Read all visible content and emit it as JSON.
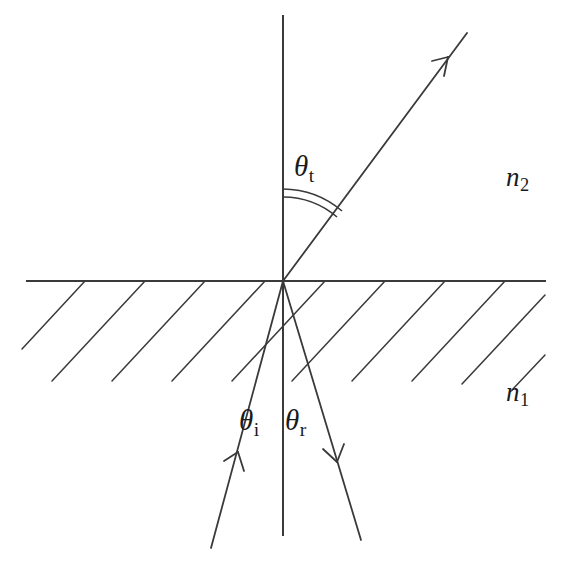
{
  "figure": {
    "type": "optics-refraction-reflection-diagram",
    "background_color": "#ffffff",
    "line_color": "#3a3a3a",
    "width": 566,
    "height": 564
  },
  "labels": {
    "theta_t": {
      "symbol": "θ",
      "subscript": "t",
      "x": 310,
      "y": 170
    },
    "theta_i": {
      "symbol": "θ",
      "subscript": "i",
      "x": 255,
      "y": 425
    },
    "theta_r": {
      "symbol": "θ",
      "subscript": "r",
      "x": 300,
      "y": 425
    },
    "n_2": {
      "symbol": "n",
      "subscript": "2",
      "x": 520,
      "y": 180
    },
    "n_1": {
      "symbol": "n",
      "subscript": "1",
      "x": 520,
      "y": 395
    }
  },
  "geometry": {
    "origin": {
      "x": 283,
      "y": 281
    },
    "interface_line": {
      "x1": 27,
      "y1": 281,
      "x2": 545,
      "y2": 281
    },
    "normal_line": {
      "x1": 283,
      "y1": 16,
      "x2": 283,
      "y2": 535
    },
    "transmitted_ray": {
      "x1": 283,
      "y1": 281,
      "x2": 467,
      "y2": 33,
      "arrow_at": {
        "x": 448,
        "y": 57
      },
      "direction": "up-right"
    },
    "incident_ray": {
      "x1": 211,
      "y1": 548,
      "x2": 283,
      "y2": 281,
      "arrow_at": {
        "x": 238,
        "y": 452
      },
      "direction": "up-right"
    },
    "reflected_ray": {
      "x1": 283,
      "y1": 281,
      "x2": 361,
      "y2": 540,
      "arrow_at": {
        "x": 337,
        "y": 450
      },
      "direction": "down-right"
    },
    "angle_arcs": [
      {
        "name": "theta-t-arc-inner",
        "radius": 84
      },
      {
        "name": "theta-t-arc-outer",
        "radius": 92
      }
    ],
    "hatching": {
      "angle_deg": 45,
      "direction": "down-left",
      "spacing": 60,
      "count": 10,
      "region": "below-interface"
    }
  }
}
